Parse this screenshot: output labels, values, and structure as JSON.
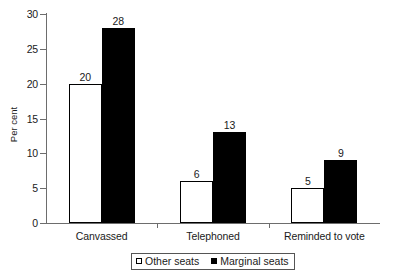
{
  "chart_data": {
    "type": "bar",
    "title": "",
    "subtitle": "",
    "xlabel": "",
    "ylabel": "Per cent",
    "categories": [
      "Canvassed",
      "Telephoned",
      "Reminded to vote"
    ],
    "series": [
      {
        "name": "Other seats",
        "values": [
          20,
          6,
          5
        ],
        "color": "#ffffff",
        "border": "#000000"
      },
      {
        "name": "Marginal seats",
        "values": [
          28,
          13,
          9
        ],
        "color": "#000000",
        "border": "#000000"
      }
    ],
    "ylim": [
      0,
      30
    ],
    "yticks": [
      0,
      5,
      10,
      15,
      20,
      25,
      30
    ],
    "ytick_labels": [
      "0",
      "5",
      "10",
      "15",
      "20",
      "25",
      "30"
    ],
    "grid": false,
    "legend_position": "bottom-center",
    "data_labels": true,
    "axis_color": "#6d6d6d",
    "text_color": "#1a1a1a"
  },
  "legend": {
    "items": [
      {
        "label": "Other seats",
        "marker": "hollow-square-marker"
      },
      {
        "label": "Marginal seats",
        "marker": "filled-square-marker"
      }
    ]
  }
}
